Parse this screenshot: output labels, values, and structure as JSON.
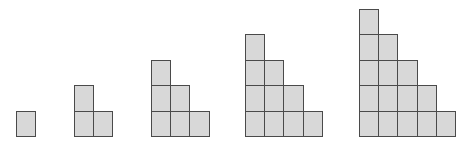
{
  "diagram": {
    "type": "staircase-pattern",
    "colors": {
      "cell_fill": "#d8d8d8",
      "cell_border": "#4a4a4a",
      "background": "#ffffff"
    },
    "cell_size": {
      "width": 19.2,
      "height": 25.4
    },
    "baseline_y": 136,
    "figures": [
      {
        "index": 1,
        "steps": 1,
        "squares": 1,
        "left": 16
      },
      {
        "index": 2,
        "steps": 2,
        "squares": 3,
        "left": 74
      },
      {
        "index": 3,
        "steps": 3,
        "squares": 6,
        "left": 151
      },
      {
        "index": 4,
        "steps": 4,
        "squares": 10,
        "left": 245
      },
      {
        "index": 5,
        "steps": 5,
        "squares": 15,
        "left": 359
      }
    ]
  }
}
